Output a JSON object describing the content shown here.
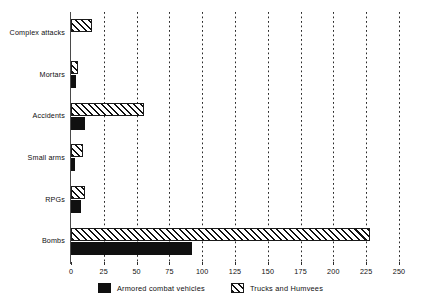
{
  "chart_data": {
    "type": "bar",
    "orientation": "horizontal",
    "title": "",
    "subtitle": "",
    "xlabel": "",
    "ylabel": "",
    "xlim": [
      0,
      250
    ],
    "ylim": null,
    "grid": true,
    "grid_style": "dotted-vertical",
    "legend_position": "bottom-center",
    "categories": [
      "Complex attacks",
      "Mortars",
      "Accidents",
      "Small arms",
      "RPGs",
      "Bombs"
    ],
    "xticks": [
      0,
      25,
      50,
      75,
      100,
      125,
      150,
      175,
      200,
      225,
      250
    ],
    "xtick_labels": [
      "0",
      "25",
      "50",
      "75",
      "100",
      "125",
      "150",
      "175",
      "200",
      "225",
      "250"
    ],
    "series": [
      {
        "name": "Armored combat vehicles",
        "pattern": "solid",
        "color": "#101010",
        "values": [
          0,
          4,
          11,
          3,
          8,
          92
        ]
      },
      {
        "name": "Trucks and Humvees",
        "pattern": "diagonal-hatch",
        "color": "#111111",
        "values": [
          16,
          5,
          56,
          9,
          11,
          228
        ]
      }
    ]
  },
  "legend": {
    "items": [
      {
        "label": "Armored combat vehicles",
        "swatch": "solid-black-square"
      },
      {
        "label": "Trucks and Humvees",
        "swatch": "hatched-square"
      }
    ]
  }
}
